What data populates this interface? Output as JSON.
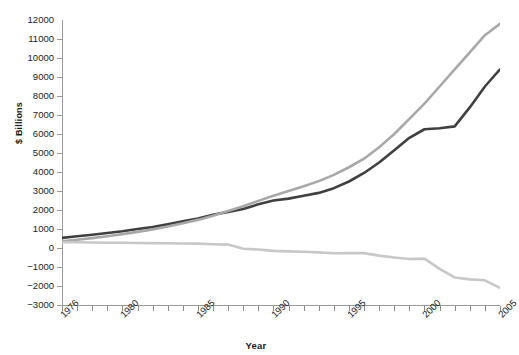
{
  "chart_data": {
    "type": "line",
    "title": "",
    "xlabel": "Year",
    "ylabel": "$ Billions",
    "xlim": [
      1976,
      2005
    ],
    "ylim": [
      -3000,
      12000
    ],
    "grid": false,
    "legend": "none",
    "ytick_labels": [
      "12000",
      "11000",
      "10000",
      "9000",
      "8000",
      "7000",
      "6000",
      "5000",
      "4000",
      "3000",
      "2000",
      "1000",
      "0",
      "-1000",
      "-2000",
      "-3000"
    ],
    "ytick_values": [
      12000,
      11000,
      10000,
      9000,
      8000,
      7000,
      6000,
      5000,
      4000,
      3000,
      2000,
      1000,
      0,
      -1000,
      -2000,
      -3000
    ],
    "xtick_values": [
      1976,
      1977,
      1978,
      1979,
      1980,
      1981,
      1982,
      1983,
      1984,
      1985,
      1986,
      1987,
      1988,
      1989,
      1990,
      1991,
      1992,
      1993,
      1994,
      1995,
      1996,
      1997,
      1998,
      1999,
      2000,
      2001,
      2002,
      2003,
      2004,
      2005
    ],
    "xtick_labeled": [
      1976,
      1980,
      1985,
      1990,
      1995,
      2000,
      2005
    ],
    "xtick_labels": [
      "1976",
      "1980",
      "1985",
      "1990",
      "1995",
      "2000",
      "2005"
    ],
    "x": [
      1976,
      1977,
      1978,
      1979,
      1980,
      1981,
      1982,
      1983,
      1984,
      1985,
      1986,
      1987,
      1988,
      1989,
      1990,
      1991,
      1992,
      1993,
      1994,
      1995,
      1996,
      1997,
      1998,
      1999,
      2000,
      2001,
      2002,
      2003,
      2004,
      2005
    ],
    "series": [
      {
        "name": "series-dark",
        "color": "#404040",
        "values": [
          530,
          620,
          700,
          790,
          880,
          1000,
          1100,
          1250,
          1400,
          1550,
          1750,
          1900,
          2050,
          2300,
          2500,
          2600,
          2750,
          2900,
          3150,
          3500,
          3950,
          4500,
          5150,
          5800,
          6250,
          6300,
          6400,
          7400,
          8500,
          9400
        ]
      },
      {
        "name": "series-medium-gray",
        "color": "#a8a8a8",
        "values": [
          350,
          430,
          520,
          620,
          730,
          850,
          980,
          1130,
          1300,
          1480,
          1700,
          1950,
          2200,
          2480,
          2750,
          3000,
          3250,
          3520,
          3850,
          4250,
          4700,
          5300,
          6000,
          6800,
          7600,
          8500,
          9400,
          10300,
          11200,
          11800
        ]
      },
      {
        "name": "series-light-gray",
        "color": "#c8c8c8",
        "values": [
          300,
          300,
          290,
          280,
          275,
          265,
          255,
          250,
          240,
          230,
          200,
          180,
          -40,
          -80,
          -150,
          -180,
          -200,
          -230,
          -280,
          -260,
          -270,
          -400,
          -500,
          -580,
          -560,
          -1100,
          -1550,
          -1650,
          -1700,
          -2100
        ]
      }
    ]
  }
}
